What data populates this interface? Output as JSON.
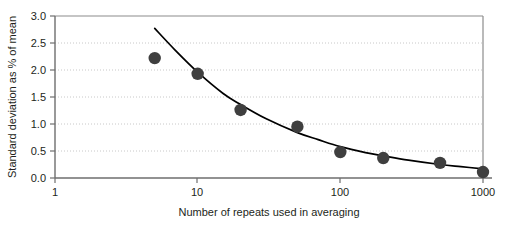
{
  "chart_data": {
    "type": "scatter",
    "title": "",
    "subtitle": "",
    "xlabel": "Number of repeats used in averaging",
    "ylabel": "Standard deviation as % of mean",
    "xscale": "log",
    "yscale": "linear",
    "xlim": [
      1,
      1000
    ],
    "ylim": [
      0.0,
      3.0
    ],
    "grid": true,
    "grid_axis": "y",
    "legend": "none",
    "x_ticks": [
      1,
      10,
      100,
      1000
    ],
    "x_tick_labels": [
      "1",
      "10",
      "100",
      "1000"
    ],
    "y_ticks": [
      0.0,
      0.5,
      1.0,
      1.5,
      2.0,
      2.5,
      3.0
    ],
    "y_tick_labels": [
      "0.0",
      "0.5",
      "1.0",
      "1.5",
      "2.0",
      "2.5",
      "3.0"
    ],
    "marker_color": "#3f3f3f",
    "line_color": "#000000",
    "axis_color": "#7f7f7f",
    "grid_color": "#c8c8c8",
    "series": [
      {
        "name": "measured standard deviation",
        "type": "scatter",
        "marker": "circle",
        "x": [
          5,
          10,
          20,
          50,
          100,
          200,
          500,
          1000
        ],
        "y": [
          2.22,
          1.93,
          1.26,
          0.95,
          0.48,
          0.37,
          0.28,
          0.11
        ]
      },
      {
        "name": "fitted curve",
        "type": "line",
        "x": [
          5,
          7,
          10,
          15,
          20,
          30,
          50,
          70,
          100,
          150,
          200,
          300,
          500,
          700,
          1000
        ],
        "y": [
          2.77,
          2.36,
          1.96,
          1.57,
          1.36,
          1.1,
          0.84,
          0.71,
          0.58,
          0.47,
          0.41,
          0.33,
          0.25,
          0.21,
          0.17
        ]
      }
    ]
  }
}
